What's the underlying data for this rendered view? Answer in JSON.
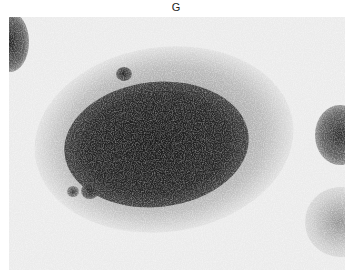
{
  "panel_label": "G",
  "image": {
    "description": "Grayscale histological micrograph showing a large dark cellular nodule with surrounding lighter tissue",
    "colors": {
      "background": "#ebebeb",
      "dark_region": "#1e1e1e",
      "mid_region": "#7a7a7a"
    }
  }
}
